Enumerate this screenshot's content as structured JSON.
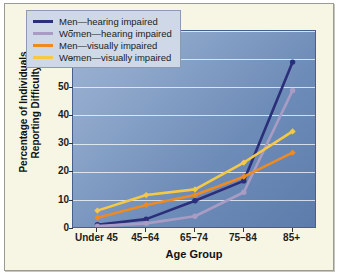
{
  "chart_data": {
    "type": "line",
    "title": "",
    "xlabel": "Age Group",
    "ylabel": "Percentage of Individuals Reporting Difficulty",
    "ylabel_line1": "Percentage of Individuals",
    "ylabel_line2": "Reporting Difficulty",
    "categories": [
      "Under 45",
      "45–64",
      "65–74",
      "75–84",
      "85+"
    ],
    "ylim": [
      0,
      70
    ],
    "yticks": [
      0,
      10,
      20,
      30,
      40,
      50,
      60,
      70
    ],
    "grid": true,
    "legend_position": "top-left",
    "series": [
      {
        "name": "Men—hearing impaired",
        "color": "#2b2e78",
        "values": [
          1.5,
          3.5,
          10,
          17,
          59
        ]
      },
      {
        "name": "Women—hearing impaired",
        "color": "#a99cc4",
        "values": [
          1,
          2,
          4.5,
          13,
          49
        ]
      },
      {
        "name": "Men—visually impaired",
        "color": "#ee8a22",
        "values": [
          4,
          8.5,
          12,
          18.5,
          27
        ]
      },
      {
        "name": "Women—visually impaired",
        "color": "#f5c945",
        "values": [
          6.5,
          12,
          14,
          23.5,
          34.5
        ]
      }
    ]
  },
  "legend": {
    "items": [
      {
        "label": "Men—hearing impaired",
        "color": "#2b2e78"
      },
      {
        "label": "Women—hearing impaired",
        "color": "#a99cc4"
      },
      {
        "label": "Men—visually impaired",
        "color": "#ee8a22"
      },
      {
        "label": "Women—visually impaired",
        "color": "#f5c945"
      }
    ]
  }
}
